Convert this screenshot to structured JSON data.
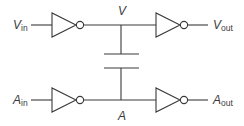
{
  "diagram": {
    "type": "circuit",
    "colors": {
      "stroke": "#3a3a3a",
      "background": "#ffffff"
    },
    "labels": {
      "v_in": {
        "main": "V",
        "sub": "in"
      },
      "v_out": {
        "main": "V",
        "sub": "out"
      },
      "a_in": {
        "main": "A",
        "sub": "in"
      },
      "a_out": {
        "main": "A",
        "sub": "out"
      },
      "node_v": "V",
      "node_a": "A"
    },
    "components": [
      {
        "type": "inverter",
        "name": "inverter-v-in"
      },
      {
        "type": "inverter",
        "name": "inverter-v-out"
      },
      {
        "type": "inverter",
        "name": "inverter-a-in"
      },
      {
        "type": "inverter",
        "name": "inverter-a-out"
      },
      {
        "type": "capacitor",
        "name": "coupling-capacitor",
        "between": [
          "V",
          "A"
        ]
      }
    ]
  }
}
